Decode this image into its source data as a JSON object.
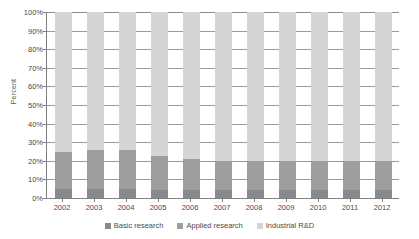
{
  "chart_data": {
    "type": "bar",
    "title": "",
    "xlabel": "",
    "ylabel": "Percent",
    "ylim": [
      0,
      100
    ],
    "grid": true,
    "stacked": true,
    "stack_mode": "percent",
    "legend_position": "bottom",
    "categories": [
      "2002",
      "2003",
      "2004",
      "2005",
      "2006",
      "2007",
      "2008",
      "2009",
      "2010",
      "2011",
      "2012"
    ],
    "ytick_labels": [
      "100%",
      "90%",
      "80%",
      "70%",
      "60%",
      "50%",
      "40%",
      "30%",
      "20%",
      "10%",
      "0%"
    ],
    "ytick_values": [
      100,
      90,
      80,
      70,
      60,
      50,
      40,
      30,
      20,
      10,
      0
    ],
    "series": [
      {
        "name": "Basic research",
        "color": "#8a8a8a",
        "values": [
          5,
          5,
          5,
          4.5,
          4.5,
          4.5,
          4.5,
          4.5,
          4.5,
          4.5,
          4.5
        ]
      },
      {
        "name": "Applied research",
        "color": "#9e9e9e",
        "values": [
          20,
          21,
          21,
          18,
          16.5,
          15.5,
          15.5,
          15.5,
          15.5,
          15.5,
          15.5
        ]
      },
      {
        "name": "Industrial R&D",
        "color": "#d5d5d5",
        "values": [
          75,
          74,
          74,
          77.5,
          79,
          80,
          80,
          80,
          80,
          80,
          80
        ]
      }
    ]
  },
  "legend": {
    "items": [
      {
        "label": "Basic research"
      },
      {
        "label": "Applied research"
      },
      {
        "label": "Industrial R&D"
      }
    ]
  }
}
